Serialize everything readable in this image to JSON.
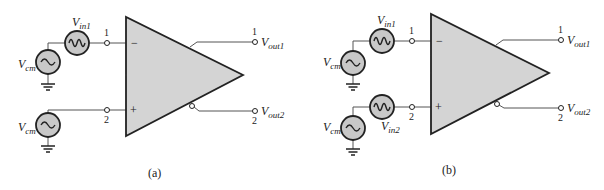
{
  "figure": {
    "panels": [
      {
        "caption": "(a)",
        "inputs": {
          "top_source": {
            "label": "V",
            "sub": "in1",
            "type": "signal-source"
          },
          "top_cm": {
            "label": "V",
            "sub": "cm",
            "type": "common-mode-source"
          },
          "bottom_cm": {
            "label": "V",
            "sub": "cm",
            "type": "common-mode-source"
          },
          "node1": "1",
          "node2": "2",
          "minus": "−",
          "plus": "+"
        },
        "outputs": {
          "out1": {
            "node": "1",
            "label": "V",
            "sub": "out1"
          },
          "out2": {
            "node": "2",
            "label": "V",
            "sub": "out2"
          }
        }
      },
      {
        "caption": "(b)",
        "inputs": {
          "top_source": {
            "label": "V",
            "sub": "in1",
            "type": "signal-source"
          },
          "top_cm": {
            "label": "V",
            "sub": "cm",
            "type": "common-mode-source"
          },
          "bottom_source": {
            "label": "V",
            "sub": "in2",
            "type": "signal-source"
          },
          "bottom_cm": {
            "label": "V",
            "sub": "cm",
            "type": "common-mode-source"
          },
          "node1": "1",
          "node2": "2",
          "minus": "−",
          "plus": "+"
        },
        "outputs": {
          "out1": {
            "node": "1",
            "label": "V",
            "sub": "out1"
          },
          "out2": {
            "node": "2",
            "label": "V",
            "sub": "out2"
          }
        }
      }
    ],
    "colors": {
      "amp_fill": "#d4d4d4",
      "source_fill": "#c8c8c8",
      "stroke": "#222222",
      "wire": "#555555"
    }
  }
}
